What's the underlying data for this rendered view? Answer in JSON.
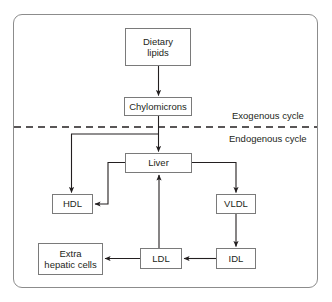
{
  "figure": {
    "frame_color": "#8c8c8c",
    "text_color": "#231f20",
    "line_color": "#231f20"
  },
  "nodes": {
    "dietary_lipids": "Dietary\nlipids",
    "chylomicrons": "Chylomicrons",
    "liver": "Liver",
    "hdl": "HDL",
    "vldl": "VLDL",
    "extra_hepatic_cells": "Extra\nhepatic cells",
    "ldl": "LDL",
    "idl": "IDL"
  },
  "labels": {
    "exogenous": "Exogenous cycle",
    "endogenous": "Endogenous cycle"
  },
  "divider": {
    "style": "dashed",
    "y": 127
  },
  "edges": [
    {
      "from": "dietary_lipids",
      "to": "chylomicrons",
      "kind": "straight-down"
    },
    {
      "from": "chylomicrons",
      "to": "liver",
      "kind": "straight-down"
    },
    {
      "from": "chylomicrons",
      "to": "hdl",
      "kind": "elbow-left-down"
    },
    {
      "from": "liver",
      "to": "hdl",
      "kind": "elbow-left-down"
    },
    {
      "from": "liver",
      "to": "vldl",
      "kind": "elbow-right-down"
    },
    {
      "from": "vldl",
      "to": "idl",
      "kind": "straight-down"
    },
    {
      "from": "idl",
      "to": "ldl",
      "kind": "straight-left"
    },
    {
      "from": "ldl",
      "to": "extra_hepatic_cells",
      "kind": "straight-left"
    },
    {
      "from": "ldl",
      "to": "liver",
      "kind": "straight-up"
    }
  ]
}
